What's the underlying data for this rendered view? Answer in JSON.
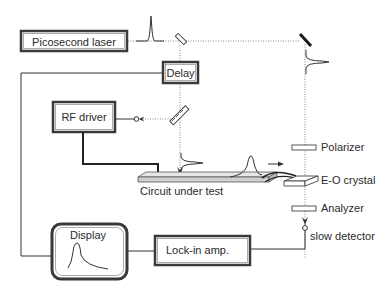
{
  "diagram": {
    "components": {
      "laser": "Picosecond laser",
      "delay": "Delay",
      "rf_driver": "RF driver",
      "circuit": "Circuit under test",
      "polarizer": "Polarizer",
      "eo_crystal": "E-O crystal",
      "analyzer": "Analyzer",
      "detector": "slow detector",
      "display": "Display",
      "lockin": "Lock-in amp."
    },
    "colors": {
      "line": "#333333",
      "beam": "#888888",
      "box_border": "#3a3a3a",
      "background": "#ffffff"
    }
  }
}
